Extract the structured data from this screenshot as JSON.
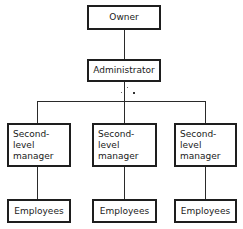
{
  "diagram": {
    "type": "org-chart",
    "nodes": {
      "owner": {
        "label": "Owner"
      },
      "administrator": {
        "label": "Administrator"
      },
      "managers": [
        {
          "label": "Second-level manager"
        },
        {
          "label": "Second-level manager"
        },
        {
          "label": "Second-level manager"
        }
      ],
      "employees": [
        {
          "label": "Employees"
        },
        {
          "label": "Employees"
        },
        {
          "label": "Employees"
        }
      ]
    },
    "edges": [
      [
        "Owner",
        "Administrator"
      ],
      [
        "Administrator",
        "Second-level manager (left)"
      ],
      [
        "Administrator",
        "Second-level manager (middle)"
      ],
      [
        "Administrator",
        "Second-level manager (right)"
      ],
      [
        "Second-level manager (left)",
        "Employees (left)"
      ],
      [
        "Second-level manager (middle)",
        "Employees (middle)"
      ],
      [
        "Second-level manager (right)",
        "Employees (right)"
      ]
    ],
    "colors": {
      "background": "#ffffff",
      "stroke": "#1e1e1e",
      "text": "#1a1a1a"
    }
  }
}
